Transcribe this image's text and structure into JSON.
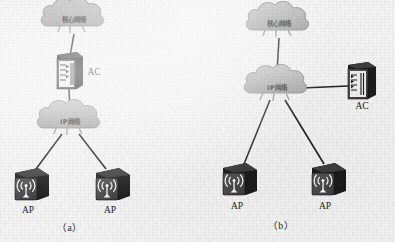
{
  "figure": {
    "background_color": "#f4f4f4",
    "panels": [
      {
        "id": "a",
        "caption": "（a）",
        "nodes": {
          "core_cloud": {
            "label": "核心网络",
            "icon": "cloud-icon",
            "x": 74,
            "y": 22
          },
          "ac_switch": {
            "label": "AC",
            "icon": "switch-icon",
            "x": 69,
            "y": 72,
            "label_x": 94,
            "label_y": 68
          },
          "ip_cloud": {
            "label": "IP网络",
            "icon": "cloud-icon",
            "x": 70,
            "y": 124
          },
          "ap_left": {
            "label": "AP",
            "icon": "wireless-ap-icon",
            "x": 32,
            "y": 185,
            "label_x": 28,
            "label_y": 210
          },
          "ap_right": {
            "label": "AP",
            "icon": "wireless-ap-icon",
            "x": 113,
            "y": 185,
            "label_x": 110,
            "label_y": 210
          }
        },
        "links": [
          {
            "from": "core_cloud",
            "to": "ac_switch"
          },
          {
            "from": "ac_switch",
            "to": "ip_cloud"
          },
          {
            "from": "ip_cloud",
            "to": "ap_left"
          },
          {
            "from": "ip_cloud",
            "to": "ap_right"
          }
        ]
      },
      {
        "id": "b",
        "caption": "（b）",
        "nodes": {
          "core_cloud": {
            "label": "核心网络",
            "icon": "cloud-icon",
            "x": 279,
            "y": 26
          },
          "ip_cloud": {
            "label": "IP网络",
            "icon": "cloud-icon",
            "x": 277,
            "y": 89
          },
          "ac_switch": {
            "label": "AC",
            "icon": "switch-icon",
            "x": 362,
            "y": 83,
            "label_x": 362,
            "label_y": 103
          },
          "ap_left": {
            "label": "AP",
            "icon": "wireless-ap-icon",
            "x": 240,
            "y": 180,
            "label_x": 237,
            "label_y": 206
          },
          "ap_right": {
            "label": "AP",
            "icon": "wireless-ap-icon",
            "x": 329,
            "y": 180,
            "label_x": 325,
            "label_y": 206
          }
        },
        "links": [
          {
            "from": "core_cloud",
            "to": "ip_cloud"
          },
          {
            "from": "ip_cloud",
            "to": "ac_switch"
          },
          {
            "from": "ip_cloud",
            "to": "ap_left"
          },
          {
            "from": "ip_cloud",
            "to": "ap_right"
          }
        ]
      }
    ],
    "colors": {
      "cloud_fill": "#b8b8b8",
      "cloud_stroke": "#8f8f8f",
      "device_front": "#4a4a4a",
      "device_side": "#1f1f1f",
      "device_top": "#3a3a3a",
      "link_stroke": "#232323",
      "text": "#222222"
    }
  }
}
